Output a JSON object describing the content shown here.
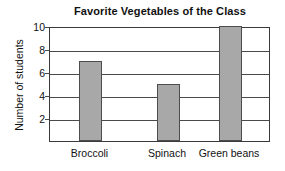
{
  "chart_data": {
    "type": "bar",
    "title": "Favorite Vegetables of the Class",
    "xlabel": "",
    "ylabel": "Number of students",
    "categories": [
      "Broccoli",
      "Spinach",
      "Green beans"
    ],
    "values": [
      7,
      5,
      10
    ],
    "ylim": [
      0,
      10
    ],
    "yticks": [
      2,
      4,
      6,
      8,
      10
    ],
    "ytick_labels": [
      "2",
      "4",
      "6",
      "8",
      "10"
    ],
    "grid": "horizontal",
    "legend": "none",
    "bar_color": "#a8a8a8",
    "bar_edge_color": "#4d4d4d",
    "axis_color": "#3a3a3a",
    "background_color": "#ffffff"
  }
}
